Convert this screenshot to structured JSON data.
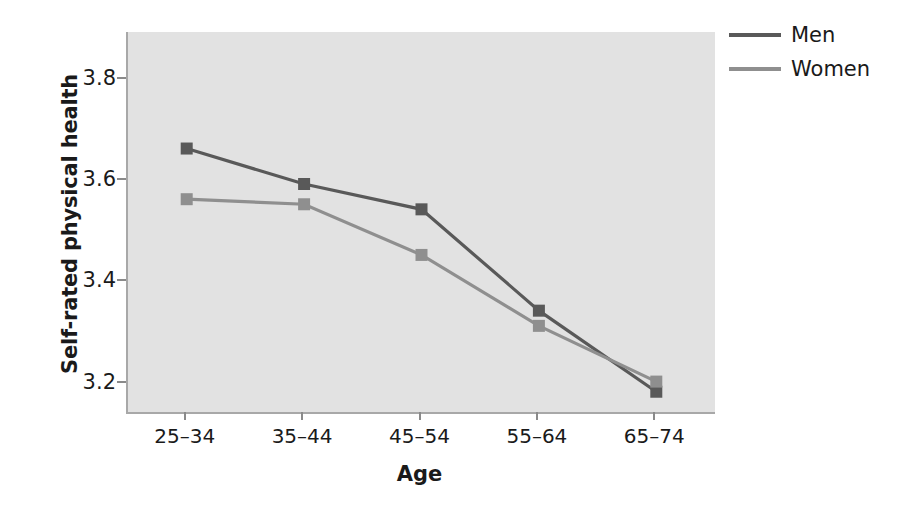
{
  "chart_data": {
    "type": "line",
    "title": "",
    "xlabel": "Age",
    "ylabel": "Self-rated physical health",
    "categories": [
      "25–34",
      "35–44",
      "45–54",
      "55–64",
      "65–74"
    ],
    "yticks": [
      "3.2",
      "3.4",
      "3.6",
      "3.8"
    ],
    "ytick_values": [
      3.2,
      3.4,
      3.6,
      3.8
    ],
    "ylim": [
      3.14,
      3.89
    ],
    "grid": false,
    "legend_position": "right-top",
    "markers": "square",
    "series": [
      {
        "name": "Men",
        "color": "#595959",
        "values": [
          3.66,
          3.59,
          3.54,
          3.34,
          3.18
        ]
      },
      {
        "name": "Women",
        "color": "#8f8f8f",
        "values": [
          3.56,
          3.55,
          3.45,
          3.31,
          3.2
        ]
      }
    ]
  },
  "legend": {
    "items": [
      {
        "label": "Men"
      },
      {
        "label": "Women"
      }
    ]
  },
  "colors": {
    "men": "#595959",
    "women": "#8f8f8f",
    "plot_background": "#e2e2e2",
    "axis": "#a8a8a8",
    "text": "#1a1a1a"
  }
}
